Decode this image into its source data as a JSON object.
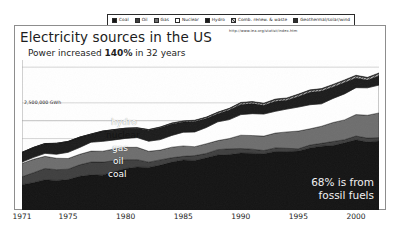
{
  "header": {
    "title": "Electricity sources in the US",
    "subtitle_before": "Power increased ",
    "subtitle_strong": "140%",
    "subtitle_after": " in 32 years",
    "url": "http://www.iea.org/statist/index.htm"
  },
  "legend": {
    "items": [
      {
        "label": "Coal",
        "color": "#141414"
      },
      {
        "label": "Oil",
        "color": "#3f3f3f"
      },
      {
        "label": "Gas",
        "color": "#6e6e6e"
      },
      {
        "label": "Nuclear",
        "color": "#ffffff"
      },
      {
        "label": "Hydro",
        "color": "#1c1c1c"
      },
      {
        "label": "Comb. renew. & waste",
        "color": "#8f8f8f"
      },
      {
        "label": "Geothermal/solar/wind",
        "color": "#2e2e2e"
      }
    ]
  },
  "annotations": {
    "y_gridline_label": "2,500,000 GWh",
    "band_labels": [
      "hydro",
      "nuclear",
      "gas",
      "oil",
      "coal"
    ],
    "callout_line1": "68% is from",
    "callout_line2": "fossil fuels"
  },
  "chart_data": {
    "type": "area",
    "title": "Electricity sources in the US",
    "subtitle": "Power increased 140% in 32 years",
    "source": "http://www.iea.org/statist/index.htm",
    "xlabel": "",
    "ylabel": "GWh",
    "stacked": true,
    "grid": true,
    "legend_position": "top",
    "xlim": [
      1971,
      2002
    ],
    "ylim": [
      0,
      4200000
    ],
    "gridlines": [
      1000000,
      2000000,
      2500000,
      3000000,
      4000000
    ],
    "labeled_gridline": {
      "value": 2500000,
      "label": "2,500,000 GWh"
    },
    "xticks": [
      1971,
      1975,
      1980,
      1985,
      1990,
      1995,
      2000
    ],
    "x": [
      1971,
      1972,
      1973,
      1974,
      1975,
      1976,
      1977,
      1978,
      1979,
      1980,
      1981,
      1982,
      1983,
      1984,
      1985,
      1986,
      1987,
      1988,
      1989,
      1990,
      1991,
      1992,
      1993,
      1994,
      1995,
      1996,
      1997,
      1998,
      1999,
      2000,
      2001,
      2002
    ],
    "units": "GWh",
    "series": [
      {
        "name": "Coal",
        "color": "#141414",
        "values": [
          710000,
          770000,
          848000,
          828000,
          853000,
          944000,
          985000,
          976000,
          1075000,
          1162000,
          1203000,
          1192000,
          1259000,
          1342000,
          1402000,
          1386000,
          1464000,
          1541000,
          1554000,
          1594000,
          1591000,
          1576000,
          1639000,
          1636000,
          1653000,
          1737000,
          1788000,
          1807000,
          1881000,
          1966000,
          1904000,
          1933000
        ]
      },
      {
        "name": "Oil",
        "color": "#3f3f3f",
        "values": [
          220000,
          274000,
          314000,
          301000,
          289000,
          320000,
          358000,
          365000,
          304000,
          246000,
          206000,
          147000,
          144000,
          120000,
          100000,
          137000,
          118000,
          149000,
          159000,
          127000,
          112000,
          89000,
          100000,
          91000,
          61000,
          81000,
          78000,
          111000,
          86000,
          105000,
          110000,
          94000
        ]
      },
      {
        "name": "Gas",
        "color": "#6e6e6e",
        "values": [
          374000,
          376000,
          341000,
          320000,
          300000,
          295000,
          306000,
          305000,
          329000,
          346000,
          346000,
          305000,
          274000,
          297000,
          292000,
          249000,
          273000,
          253000,
          289000,
          373000,
          382000,
          404000,
          415000,
          460000,
          496000,
          455000,
          479000,
          531000,
          556000,
          601000,
          639000,
          691000
        ]
      },
      {
        "name": "Nuclear",
        "color": "#ffffff",
        "values": [
          38000,
          54000,
          83000,
          114000,
          173000,
          191000,
          251000,
          276000,
          255000,
          251000,
          273000,
          283000,
          294000,
          328000,
          384000,
          414000,
          455000,
          527000,
          529000,
          577000,
          613000,
          619000,
          610000,
          640000,
          673000,
          675000,
          629000,
          674000,
          728000,
          754000,
          769000,
          780000
        ]
      },
      {
        "name": "Hydro",
        "color": "#1c1c1c",
        "values": [
          270000,
          276000,
          272000,
          301000,
          300000,
          284000,
          221000,
          280000,
          280000,
          276000,
          261000,
          309000,
          332000,
          321000,
          284000,
          291000,
          250000,
          223000,
          266000,
          286000,
          281000,
          243000,
          280000,
          247000,
          296000,
          347000,
          356000,
          323000,
          318000,
          273000,
          217000,
          264000
        ]
      },
      {
        "name": "Comb. renew. & waste",
        "color": "#8f8f8f",
        "values": [
          2000,
          2000,
          2000,
          3000,
          3000,
          4000,
          5000,
          6000,
          7000,
          8000,
          10000,
          12000,
          15000,
          19000,
          23000,
          27000,
          31000,
          35000,
          38000,
          41000,
          43000,
          45000,
          46000,
          48000,
          50000,
          51000,
          52000,
          53000,
          54000,
          56000,
          56000,
          57000
        ]
      },
      {
        "name": "Geothermal/solar/wind",
        "color": "#2e2e2e",
        "values": [
          1000,
          1000,
          2000,
          2000,
          3000,
          3000,
          4000,
          4000,
          4000,
          5000,
          6000,
          6000,
          7000,
          8000,
          10000,
          11000,
          12000,
          13000,
          14000,
          15000,
          16000,
          16000,
          17000,
          17000,
          17000,
          18000,
          18000,
          18000,
          19000,
          19000,
          19000,
          20000
        ]
      }
    ],
    "callout": "68% is from fossil fuels"
  }
}
